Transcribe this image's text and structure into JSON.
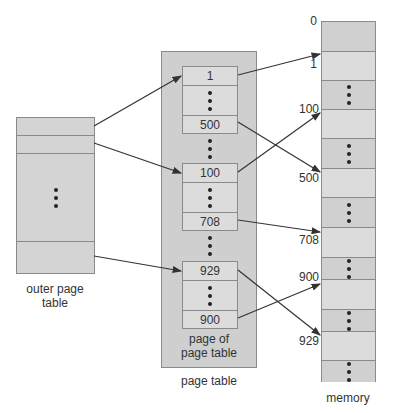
{
  "outer_page_table": {
    "label": "outer page table",
    "label_line1": "outer page",
    "label_line2": "table",
    "rows": [
      "",
      "",
      "dots",
      ""
    ]
  },
  "page_table": {
    "label": "page table",
    "inner_label_line1": "page of",
    "inner_label_line2": "page table",
    "pages": [
      {
        "entries": [
          "1",
          "dots",
          "500"
        ]
      },
      {
        "entries": [
          "100",
          "dots",
          "708"
        ]
      },
      {
        "entries": [
          "929",
          "dots",
          "900"
        ]
      }
    ]
  },
  "memory": {
    "label": "memory",
    "addresses": [
      "0",
      "1",
      "100",
      "500",
      "708",
      "900",
      "929"
    ],
    "frames": [
      {
        "addr": "0",
        "type": "frame"
      },
      {
        "addr": "1",
        "type": "frame"
      },
      {
        "addr": "",
        "type": "dots"
      },
      {
        "addr": "100",
        "type": "frame"
      },
      {
        "addr": "",
        "type": "dots"
      },
      {
        "addr": "500",
        "type": "frame"
      },
      {
        "addr": "",
        "type": "dots"
      },
      {
        "addr": "708",
        "type": "frame"
      },
      {
        "addr": "",
        "type": "dots"
      },
      {
        "addr": "900",
        "type": "frame"
      },
      {
        "addr": "",
        "type": "dots"
      },
      {
        "addr": "929",
        "type": "frame"
      },
      {
        "addr": "",
        "type": "dots"
      }
    ]
  },
  "mappings": [
    {
      "from": "outer row 1",
      "to": "page 1 (entry 1)"
    },
    {
      "from": "outer row 2",
      "to": "page 2 (entry 100)"
    },
    {
      "from": "outer last row",
      "to": "page 3 (entry 929)"
    },
    {
      "from": "entry 1",
      "to": "memory 1"
    },
    {
      "from": "entry 500",
      "to": "memory 500"
    },
    {
      "from": "entry 100",
      "to": "memory 100"
    },
    {
      "from": "entry 708",
      "to": "memory 708"
    },
    {
      "from": "entry 929",
      "to": "memory 929"
    },
    {
      "from": "entry 900",
      "to": "memory 900"
    }
  ],
  "colors": {
    "fill": "#d4d4d4",
    "border": "#8a8a8a",
    "arrow": "#333333",
    "text": "#333333"
  }
}
